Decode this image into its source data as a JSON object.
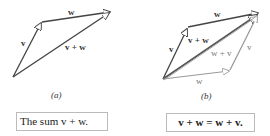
{
  "figure_a": {
    "label": "(a)",
    "vectors": {
      "v": "v",
      "w": "w",
      "sum": "v + w"
    },
    "caption": "The sum  v + w."
  },
  "figure_b": {
    "label": "(b)",
    "vectors": {
      "v_left": "v",
      "w_top": "w",
      "v_plus_w": "v + w",
      "w_plus_v": "w + v",
      "v_right": "v",
      "w_bottom": "w"
    },
    "caption": "v + w = w + v."
  },
  "colors": {
    "dark_vector": "#444444",
    "light_vector": "#999999",
    "caption_border": "#bbbbbb"
  }
}
